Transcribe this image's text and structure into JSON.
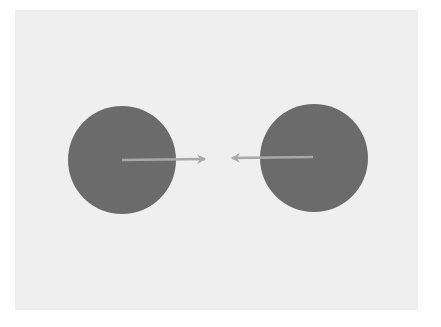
{
  "diagram": {
    "colors": {
      "page": "#ffffff",
      "panel": "#efefef",
      "body": "#6b6b6b",
      "arrow": "#a8a8a8"
    },
    "panel": {
      "x": 15,
      "y": 10,
      "width": 403,
      "height": 300
    },
    "bodies": [
      {
        "id": "left-body",
        "cx": 122,
        "cy": 160,
        "r": 54
      },
      {
        "id": "right-body",
        "cx": 314,
        "cy": 158,
        "r": 54
      }
    ],
    "arrows": [
      {
        "id": "left-force-arrow",
        "x1": 122,
        "y1": 160,
        "x2": 205,
        "y2": 159
      },
      {
        "id": "right-force-arrow",
        "x1": 313,
        "y1": 157,
        "x2": 232,
        "y2": 158
      }
    ]
  }
}
